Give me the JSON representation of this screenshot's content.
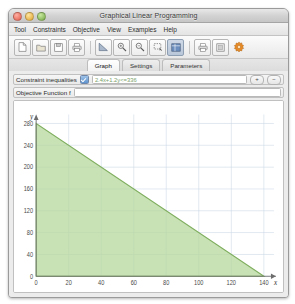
{
  "window": {
    "title": "Graphical Linear Programming",
    "traffic_lights": [
      "close",
      "minimize",
      "zoom"
    ]
  },
  "menubar": {
    "items": [
      {
        "label": "Tool"
      },
      {
        "label": "Constraints"
      },
      {
        "label": "Objective"
      },
      {
        "label": "View"
      },
      {
        "label": "Examples"
      },
      {
        "label": "Help"
      }
    ]
  },
  "toolbar": {
    "groups": [
      {
        "buttons": [
          {
            "icon": "new-document-icon",
            "active": false
          },
          {
            "icon": "open-folder-icon",
            "active": false
          },
          {
            "icon": "save-disk-icon",
            "active": false
          },
          {
            "icon": "print-icon",
            "active": false
          }
        ]
      },
      {
        "buttons": [
          {
            "icon": "region-shade-icon",
            "active": false
          },
          {
            "icon": "zoom-in-icon",
            "active": false
          },
          {
            "icon": "zoom-out-icon",
            "active": false
          },
          {
            "icon": "selection-rect-icon",
            "active": false
          },
          {
            "icon": "grid-view-icon",
            "active": true
          }
        ]
      },
      {
        "buttons": [
          {
            "icon": "export-print-icon",
            "active": false
          },
          {
            "icon": "window-panel-icon",
            "active": false
          },
          {
            "icon": "preferences-gear-icon",
            "active": false
          }
        ]
      }
    ]
  },
  "tabs": {
    "items": [
      {
        "label": "Graph",
        "active": true
      },
      {
        "label": "Settings",
        "active": false
      },
      {
        "label": "Parameters",
        "active": false
      }
    ]
  },
  "constraint_row": {
    "label": "Constraint inequalities",
    "checkbox_checked": true,
    "value": "2.4x+1.2y<=336",
    "placeholder": "",
    "add_button": "+",
    "remove_button": "−"
  },
  "objective_row": {
    "label": "Objective Function f",
    "value": "",
    "placeholder": ""
  },
  "chart_data": {
    "type": "area",
    "title": "",
    "xlabel": "x",
    "ylabel": "y",
    "xlim": [
      0,
      145
    ],
    "ylim": [
      0,
      290
    ],
    "xticks": [
      0,
      20,
      40,
      60,
      80,
      100,
      120,
      140
    ],
    "yticks": [
      0,
      40,
      80,
      120,
      160,
      200,
      240,
      280
    ],
    "grid": true,
    "series": [
      {
        "name": "2.4x+1.2y<=336",
        "type": "feasible-region",
        "boundary_points": [
          [
            0,
            280
          ],
          [
            140,
            0
          ]
        ],
        "polygon": [
          [
            0,
            0
          ],
          [
            0,
            280
          ],
          [
            140,
            0
          ]
        ],
        "fill_color": "#b9d8a0",
        "line_color": "#7fae5e"
      }
    ],
    "legend": []
  },
  "colors": {
    "region_fill": "#b9d8a0",
    "region_line": "#7fae5e",
    "grid": "#c8d4e4",
    "axis": "#6d6d6d",
    "accent": "#5e93cd"
  }
}
